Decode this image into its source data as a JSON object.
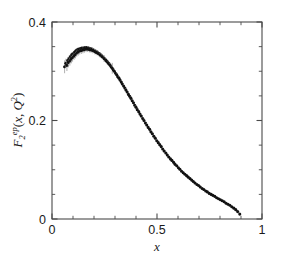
{
  "figure": {
    "background_color": "#ffffff",
    "frame_color": "#4a4a4a",
    "marker_color": "#111111",
    "errorbar_color": "#9a9a9a"
  },
  "axes": {
    "x_title": "x",
    "y_title_base": "F",
    "y_title_sub": "2",
    "y_title_sup": "ep",
    "y_title_tail_open": "(",
    "y_title_var": "x",
    "y_title_comma": ", ",
    "y_title_q": "Q",
    "y_title_q_sup": "2",
    "y_title_tail_close": ")",
    "x_tick_labels": [
      "0",
      "0.5",
      "1"
    ],
    "x_tick_values": [
      0,
      0.5,
      1
    ],
    "y_tick_labels": [
      "0",
      "0.2",
      "0.4"
    ],
    "y_tick_values": [
      0,
      0.2,
      0.4
    ],
    "x_minor_step": 0.1,
    "y_minor_step": 0.05
  },
  "chart_data": {
    "type": "scatter",
    "title": "",
    "subtitle": "",
    "xlabel": "x",
    "ylabel": "F_2^{ep}(x, Q^2)",
    "xlim": [
      0,
      1
    ],
    "ylim": [
      0,
      0.4
    ],
    "grid": false,
    "legend": null,
    "annotations": [],
    "series": [
      {
        "name": "F_2^{ep} measurements",
        "marker": "filled-circle",
        "x": [
          0.06,
          0.066,
          0.071,
          0.075,
          0.078,
          0.082,
          0.085,
          0.088,
          0.092,
          0.095,
          0.098,
          0.102,
          0.105,
          0.108,
          0.112,
          0.115,
          0.118,
          0.122,
          0.125,
          0.129,
          0.132,
          0.136,
          0.14,
          0.143,
          0.147,
          0.151,
          0.154,
          0.158,
          0.162,
          0.166,
          0.17,
          0.174,
          0.178,
          0.182,
          0.186,
          0.19,
          0.194,
          0.198,
          0.203,
          0.207,
          0.211,
          0.216,
          0.22,
          0.225,
          0.229,
          0.234,
          0.238,
          0.243,
          0.248,
          0.252,
          0.257,
          0.262,
          0.267,
          0.272,
          0.277,
          0.282,
          0.287,
          0.292,
          0.297,
          0.303,
          0.308,
          0.313,
          0.319,
          0.324,
          0.33,
          0.335,
          0.341,
          0.347,
          0.352,
          0.358,
          0.364,
          0.37,
          0.376,
          0.382,
          0.388,
          0.394,
          0.4,
          0.406,
          0.413,
          0.419,
          0.425,
          0.432,
          0.438,
          0.445,
          0.451,
          0.458,
          0.465,
          0.471,
          0.478,
          0.485,
          0.492,
          0.499,
          0.506,
          0.513,
          0.52,
          0.527,
          0.534,
          0.542,
          0.549,
          0.556,
          0.564,
          0.571,
          0.579,
          0.586,
          0.594,
          0.602,
          0.609,
          0.617,
          0.625,
          0.633,
          0.641,
          0.649,
          0.657,
          0.665,
          0.673,
          0.681,
          0.69,
          0.698,
          0.706,
          0.715,
          0.723,
          0.732,
          0.74,
          0.749,
          0.758,
          0.766,
          0.775,
          0.784,
          0.793,
          0.802,
          0.811,
          0.82,
          0.829,
          0.838,
          0.847,
          0.856,
          0.866,
          0.875,
          0.884,
          0.894
        ],
        "y": [
          0.309,
          0.316,
          0.312,
          0.322,
          0.318,
          0.326,
          0.321,
          0.33,
          0.325,
          0.334,
          0.328,
          0.336,
          0.331,
          0.339,
          0.334,
          0.342,
          0.337,
          0.344,
          0.339,
          0.345,
          0.341,
          0.346,
          0.342,
          0.347,
          0.343,
          0.347,
          0.344,
          0.348,
          0.345,
          0.348,
          0.345,
          0.347,
          0.344,
          0.346,
          0.343,
          0.345,
          0.342,
          0.343,
          0.34,
          0.341,
          0.338,
          0.339,
          0.336,
          0.336,
          0.333,
          0.333,
          0.33,
          0.329,
          0.326,
          0.325,
          0.322,
          0.32,
          0.317,
          0.315,
          0.312,
          0.309,
          0.306,
          0.303,
          0.3,
          0.296,
          0.293,
          0.289,
          0.286,
          0.282,
          0.278,
          0.274,
          0.27,
          0.266,
          0.262,
          0.258,
          0.253,
          0.249,
          0.245,
          0.24,
          0.236,
          0.231,
          0.227,
          0.222,
          0.218,
          0.213,
          0.209,
          0.204,
          0.2,
          0.195,
          0.191,
          0.186,
          0.182,
          0.177,
          0.173,
          0.168,
          0.164,
          0.159,
          0.155,
          0.151,
          0.147,
          0.142,
          0.138,
          0.134,
          0.13,
          0.126,
          0.122,
          0.119,
          0.115,
          0.111,
          0.108,
          0.104,
          0.101,
          0.097,
          0.094,
          0.091,
          0.088,
          0.085,
          0.082,
          0.079,
          0.076,
          0.073,
          0.07,
          0.068,
          0.065,
          0.062,
          0.06,
          0.057,
          0.055,
          0.052,
          0.05,
          0.048,
          0.046,
          0.043,
          0.041,
          0.039,
          0.037,
          0.035,
          0.032,
          0.03,
          0.028,
          0.025,
          0.022,
          0.019,
          0.015,
          0.01
        ],
        "yerr": [
          0.013,
          0.0095,
          0.0115,
          0.007,
          0.01,
          0.006,
          0.0095,
          0.0055,
          0.009,
          0.005,
          0.0085,
          0.0048,
          0.008,
          0.0045,
          0.0078,
          0.0042,
          0.0075,
          0.004,
          0.0072,
          0.0038,
          0.007,
          0.0036,
          0.0068,
          0.0035,
          0.0066,
          0.0034,
          0.0064,
          0.0033,
          0.0062,
          0.0032,
          0.006,
          0.0031,
          0.0058,
          0.003,
          0.0057,
          0.0029,
          0.0056,
          0.0029,
          0.0055,
          0.0028,
          0.0054,
          0.0028,
          0.0053,
          0.0027,
          0.0052,
          0.0027,
          0.0051,
          0.0027,
          0.007,
          0.0026,
          0.005,
          0.0026,
          0.0049,
          0.0026,
          0.0048,
          0.0025,
          0.011,
          0.0025,
          0.0047,
          0.0025,
          0.0046,
          0.0024,
          0.0045,
          0.0024,
          0.0044,
          0.0024,
          0.0043,
          0.0023,
          0.0042,
          0.0023,
          0.0041,
          0.0023,
          0.004,
          0.0022,
          0.004,
          0.0022,
          0.0039,
          0.0022,
          0.0038,
          0.0021,
          0.0038,
          0.0021,
          0.0037,
          0.0021,
          0.0036,
          0.002,
          0.0036,
          0.002,
          0.0035,
          0.002,
          0.0034,
          0.0019,
          0.0034,
          0.0019,
          0.0033,
          0.0019,
          0.0032,
          0.0018,
          0.0032,
          0.0018,
          0.0031,
          0.0018,
          0.003,
          0.0017,
          0.003,
          0.0017,
          0.0029,
          0.0017,
          0.0028,
          0.0016,
          0.0028,
          0.0016,
          0.0027,
          0.0016,
          0.0026,
          0.0015,
          0.0026,
          0.0015,
          0.0025,
          0.0015,
          0.0024,
          0.0014,
          0.0024,
          0.0014,
          0.0023,
          0.0014,
          0.0022,
          0.0013,
          0.0022,
          0.0013,
          0.0021,
          0.0013,
          0.002,
          0.0012,
          0.002,
          0.0012,
          0.0019,
          0.0012,
          0.0018,
          0.0011
        ]
      }
    ]
  }
}
